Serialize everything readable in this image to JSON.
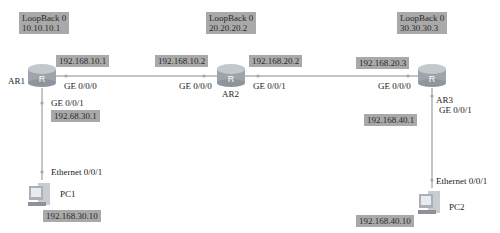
{
  "colors": {
    "label_bg": "#a9a9a9",
    "link": "#8a8a8a",
    "router_body": "#9ea4ab",
    "router_top": "#c3c8cd"
  },
  "routers": [
    {
      "name": "AR1",
      "loopback_title": "LoopBack 0",
      "loopback_ip": "10.10.10.1"
    },
    {
      "name": "AR2",
      "loopback_title": "LoopBack 0",
      "loopback_ip": "20.20.20.2"
    },
    {
      "name": "AR3",
      "loopback_title": "LoopBack 0",
      "loopback_ip": "30.30.30.3"
    }
  ],
  "pcs": [
    {
      "name": "PC1",
      "interface": "Ethernet 0/0/1",
      "ip": "192.168.30.10"
    },
    {
      "name": "PC2",
      "interface": "Ethernet 0/0/1",
      "ip": "192.168.40.10"
    }
  ],
  "interfaces": {
    "ar1_g000": {
      "port": "GE 0/0/0",
      "ip": "192.168.10.1"
    },
    "ar1_g001": {
      "port": "GE 0/0/1",
      "ip": "192.68.30.1"
    },
    "ar2_g000": {
      "port": "GE 0/0/0",
      "ip": "192.168.10.2"
    },
    "ar2_g001": {
      "port": "GE 0/0/1",
      "ip": "192.168.20.2"
    },
    "ar3_g000": {
      "port": "GE 0/0/0",
      "ip": "192.168.20.3"
    },
    "ar3_g001": {
      "port": "GE 0/0/1",
      "ip": "192.168.40.1"
    }
  }
}
